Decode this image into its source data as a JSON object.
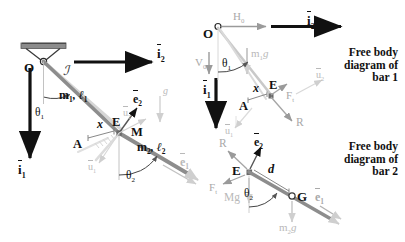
{
  "figure": {
    "type": "mechanics-free-body-diagram",
    "colors": {
      "ink": "#111111",
      "bar": "#7a7a7a",
      "ghost": "#c9c9c9",
      "ghost_light": "#dcdcdc",
      "force_gray": "#9a9a9a",
      "support": "#8c8c8c"
    }
  },
  "main_diagram": {
    "pivot_label": "O",
    "frame_label": "ℐ",
    "basis_i2": "i",
    "basis_i2_sub": "2",
    "basis_i1": "i",
    "basis_i1_sub": "1",
    "bar1_props": "m",
    "bar1_props_sub1": "1",
    "bar1_props_mid": ", ℓ",
    "bar1_props_sub2": "1",
    "bar2_props": "m",
    "bar2_props_sub1": "2",
    "bar2_props_mid": ", ℓ",
    "bar2_props_sub2": "2",
    "theta1": "θ",
    "theta1_sub": "1",
    "theta2": "θ",
    "theta2_sub": "2",
    "point_A": "A",
    "point_E": "E",
    "point_M": "M",
    "dist_x": "x",
    "e2_label": "e",
    "e2_sub": "2",
    "e1_label": "e",
    "e1_sub": "1",
    "ghost_u2": "u",
    "ghost_u2_sub": "2",
    "ghost_u1": "u",
    "ghost_u1_sub": "1",
    "ghost_g": "g"
  },
  "fbd_bar1": {
    "title": "Free body\ndiagram of\nbar 1",
    "pivot_label": "O",
    "reaction_H": "H",
    "reaction_H_sub": "0",
    "reaction_V": "V",
    "reaction_V_sub": "0",
    "weight": "m",
    "weight_sub": "1",
    "weight_g": "g",
    "theta1": "θ",
    "theta1_sub": "1",
    "point_A": "A",
    "point_E": "E",
    "dist_x": "x",
    "force_Ft": "F",
    "force_Ft_sub": "t",
    "force_R": "R",
    "basis_i2": "i",
    "basis_i2_sub": "2",
    "basis_i1": "i",
    "basis_i1_sub": "1",
    "ghost_u2": "u",
    "ghost_u2_sub": "2",
    "ghost_u1": "u",
    "ghost_u1_sub": "1"
  },
  "fbd_bar2": {
    "title": "Free body\ndiagram of\nbar 2",
    "point_E": "E",
    "point_G": "G",
    "dist_d": "d",
    "force_R": "R",
    "force_Ft": "F",
    "force_Ft_sub": "t",
    "weight_Mg": "Mg",
    "weight_m2g": "m",
    "weight_m2g_sub": "2",
    "weight_m2g_g": "g",
    "theta2": "θ",
    "theta2_sub": "2",
    "e2_label": "e",
    "e2_sub": "2",
    "e1_label": "e",
    "e1_sub": "1"
  }
}
